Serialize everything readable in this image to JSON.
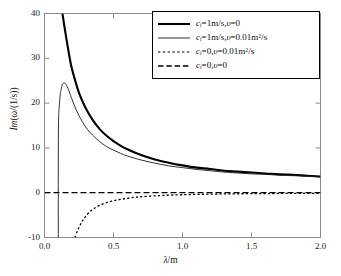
{
  "figure": {
    "background_color": "#ffffff",
    "frame_color": "#7a7a7a"
  },
  "axes": {
    "x_label": "λ/m",
    "y_label": "Im(ω/(1/s))",
    "x_ticks": [
      "0.0",
      "0.5",
      "1.0",
      "1.5",
      "2.0"
    ],
    "y_ticks": [
      "40",
      "30",
      "20",
      "10",
      "0",
      "-10"
    ]
  },
  "legend": {
    "items": [
      {
        "label": "cᵢ=1m/s,υ=0",
        "style": "solid-thick",
        "color": "#000000"
      },
      {
        "label": "cᵢ=1m/s,υ=0.01m²/s",
        "style": "solid-thin",
        "color": "#1a1a1a"
      },
      {
        "label": "cᵢ=0,υ=0.01m²/s",
        "style": "dotted",
        "color": "#000000"
      },
      {
        "label": "cᵢ=0,υ=0",
        "style": "dashed",
        "color": "#000000"
      }
    ]
  },
  "chart_data": {
    "type": "line",
    "title": "",
    "xlabel": "λ/m",
    "ylabel": "Im(ω/(1/s))",
    "xlim": [
      0.0,
      2.0
    ],
    "ylim": [
      -10,
      40
    ],
    "xticks": [
      0.0,
      0.5,
      1.0,
      1.5,
      2.0
    ],
    "yticks": [
      -10,
      0,
      10,
      20,
      30,
      40
    ],
    "grid": false,
    "legend_position": "top-right",
    "series": [
      {
        "name": "c_i=1m/s,v=0",
        "style": "solid-thick",
        "color": "#000000",
        "x": [
          0.13,
          0.15,
          0.18,
          0.2,
          0.25,
          0.3,
          0.35,
          0.4,
          0.45,
          0.5,
          0.55,
          0.6,
          0.7,
          0.8,
          0.9,
          1.0,
          1.1,
          1.2,
          1.3,
          1.4,
          1.5,
          1.6,
          1.7,
          1.8,
          1.9,
          2.0
        ],
        "y": [
          40.0,
          36.0,
          30.5,
          27.5,
          22.3,
          18.8,
          16.2,
          14.2,
          12.7,
          11.5,
          10.5,
          9.7,
          8.4,
          7.4,
          6.7,
          6.1,
          5.6,
          5.3,
          4.9,
          4.7,
          4.5,
          4.3,
          4.1,
          4.0,
          3.8,
          3.6
        ]
      },
      {
        "name": "c_i=1m/s,v=0.01m2/s",
        "style": "solid-thin",
        "color": "#1a1a1a",
        "x": [
          0.1,
          0.101,
          0.11,
          0.12,
          0.13,
          0.14,
          0.15,
          0.16,
          0.17,
          0.18,
          0.2,
          0.22,
          0.25,
          0.3,
          0.35,
          0.4,
          0.45,
          0.5,
          0.55,
          0.6,
          0.7,
          0.8,
          0.9,
          1.0,
          1.1,
          1.2,
          1.3,
          1.4,
          1.5,
          1.6,
          1.7,
          1.8,
          1.9,
          2.0
        ],
        "y": [
          -10.0,
          14.0,
          20.5,
          23.0,
          24.2,
          24.5,
          24.4,
          24.0,
          23.3,
          22.5,
          20.8,
          19.2,
          17.2,
          14.6,
          12.8,
          11.4,
          10.3,
          9.5,
          8.8,
          8.2,
          7.3,
          6.6,
          6.0,
          5.6,
          5.2,
          4.9,
          4.6,
          4.4,
          4.2,
          4.1,
          3.9,
          3.8,
          3.7,
          3.5
        ]
      },
      {
        "name": "c_i=0,v=0.01m2/s",
        "style": "dotted",
        "color": "#000000",
        "x": [
          0.22,
          0.24,
          0.26,
          0.28,
          0.3,
          0.33,
          0.36,
          0.4,
          0.45,
          0.5,
          0.55,
          0.6,
          0.65,
          0.7,
          0.8,
          0.9,
          1.0,
          1.1,
          1.2,
          1.3,
          1.4,
          1.5,
          1.6,
          1.7,
          1.8,
          1.9,
          2.0
        ],
        "y": [
          -10.0,
          -8.4,
          -7.1,
          -6.0,
          -5.2,
          -4.2,
          -3.5,
          -2.8,
          -2.2,
          -1.8,
          -1.5,
          -1.25,
          -1.05,
          -0.9,
          -0.7,
          -0.55,
          -0.45,
          -0.38,
          -0.32,
          -0.27,
          -0.24,
          -0.21,
          -0.19,
          -0.17,
          -0.15,
          -0.14,
          -0.13
        ]
      },
      {
        "name": "c_i=0,v=0",
        "style": "dashed",
        "color": "#000000",
        "x": [
          0.0,
          2.0
        ],
        "y": [
          0.0,
          0.0
        ]
      }
    ]
  }
}
